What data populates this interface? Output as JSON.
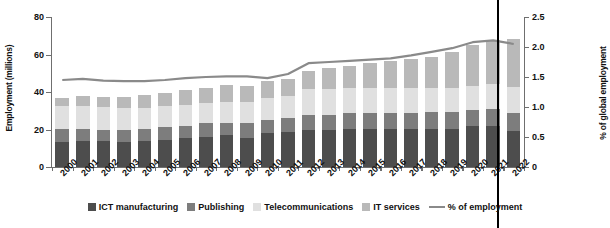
{
  "chart_data": {
    "type": "bar",
    "subtype": "stacked-bar-with-line",
    "title": "",
    "xlabel": "",
    "ylabel": "Employment (millions)",
    "y2label": "% of global employment",
    "ylim": [
      0,
      80
    ],
    "y2lim": [
      0,
      2.5
    ],
    "grid": false,
    "legend_position": "bottom",
    "categories": [
      "2000",
      "2001",
      "2002",
      "2003",
      "2004",
      "2005",
      "2006",
      "2007",
      "2008",
      "2009",
      "2010",
      "2011",
      "2012",
      "2013",
      "2014",
      "2015",
      "2016",
      "2017",
      "2018",
      "2019",
      "2020",
      "2021",
      "2022"
    ],
    "yticks": [
      0,
      20,
      40,
      60,
      80
    ],
    "y2ticks": [
      "0",
      "0.5",
      "1.0",
      "1.5",
      "2.0",
      "2.5"
    ],
    "series": [
      {
        "name": "ICT manufacturing",
        "color": "#4d4d4d",
        "axis": "left",
        "values": [
          13.6,
          14.0,
          13.7,
          13.6,
          13.8,
          14.6,
          15.4,
          16.0,
          16.9,
          15.7,
          18.1,
          18.6,
          19.6,
          19.7,
          20.1,
          20.2,
          20.1,
          20.4,
          20.4,
          20.3,
          22.1,
          21.8,
          19.3
        ]
      },
      {
        "name": "Publishing",
        "color": "#7d7d7d",
        "axis": "left",
        "values": [
          6.6,
          6.2,
          6.3,
          6.4,
          6.6,
          6.7,
          6.7,
          7.3,
          6.8,
          7.7,
          7.0,
          7.4,
          8.1,
          8.3,
          8.6,
          8.7,
          8.7,
          8.6,
          8.7,
          9.1,
          8.4,
          9.2,
          9.6
        ]
      },
      {
        "name": "Telecommunications",
        "color": "#e0e0e0",
        "axis": "left",
        "values": [
          12.2,
          12.3,
          11.8,
          11.6,
          11.2,
          11.1,
          11.0,
          10.9,
          11.2,
          11.5,
          11.6,
          12.1,
          13.8,
          13.6,
          13.4,
          13.5,
          13.3,
          13.2,
          13.2,
          13.0,
          12.9,
          13.4,
          14.0
        ]
      },
      {
        "name": "IT services",
        "color": "#b9b9b9",
        "axis": "left",
        "values": [
          4.5,
          5.4,
          5.6,
          5.9,
          6.8,
          7.1,
          7.9,
          8.2,
          8.6,
          8.5,
          9.1,
          8.7,
          9.9,
          11.3,
          12.0,
          12.9,
          14.2,
          15.3,
          16.4,
          19.0,
          21.8,
          23.4,
          25.3
        ]
      },
      {
        "name": "% of employment",
        "color": "#8a8a8a",
        "axis": "right",
        "render": "line",
        "values": [
          1.45,
          1.47,
          1.44,
          1.43,
          1.43,
          1.45,
          1.48,
          1.5,
          1.51,
          1.51,
          1.48,
          1.55,
          1.73,
          1.75,
          1.77,
          1.79,
          1.81,
          1.86,
          1.92,
          1.98,
          2.08,
          2.11,
          2.05
        ]
      }
    ],
    "annotations": [
      {
        "type": "vline",
        "at_category": "2020",
        "color": "#000000"
      }
    ]
  },
  "axes": {
    "left": {
      "label": "Employment (millions)",
      "ticks": [
        "0",
        "20",
        "40",
        "60",
        "80"
      ]
    },
    "right": {
      "label": "% of global employment",
      "ticks": [
        "0",
        "0.5",
        "1.0",
        "1.5",
        "2.0",
        "2.5"
      ]
    }
  },
  "legend": {
    "items": [
      {
        "label": "ICT manufacturing",
        "color": "#4d4d4d",
        "shape": "square"
      },
      {
        "label": "Publishing",
        "color": "#7d7d7d",
        "shape": "square"
      },
      {
        "label": "Telecommunications",
        "color": "#e0e0e0",
        "shape": "square"
      },
      {
        "label": "IT services",
        "color": "#b9b9b9",
        "shape": "square"
      },
      {
        "label": "% of employment",
        "color": "#8a8a8a",
        "shape": "line"
      }
    ]
  }
}
